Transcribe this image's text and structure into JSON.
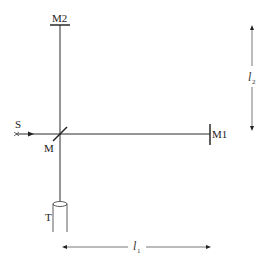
{
  "diagram": {
    "type": "Michelson interferometer",
    "labels": {
      "source": "S",
      "beam_splitter": "M",
      "mirror1": "M1",
      "mirror2": "M2",
      "telescope": "T",
      "length1": "l",
      "length1_sub": "1",
      "length2": "l",
      "length2_sub": "2"
    },
    "colors": {
      "line": "#2a2a2a",
      "arrow": "#555555"
    }
  }
}
